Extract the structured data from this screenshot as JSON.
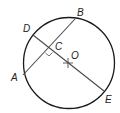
{
  "diagram": {
    "type": "circle-chord-geometry",
    "circle": {
      "center": [
        69,
        63
      ],
      "radius": 46,
      "stroke": "#1a1a1a"
    },
    "points": {
      "A": {
        "label": "A",
        "pos": [
          23,
          75
        ]
      },
      "B": {
        "label": "B",
        "pos": [
          75,
          19
        ]
      },
      "C": {
        "label": "C",
        "pos": [
          49,
          49
        ]
      },
      "D": {
        "label": "D",
        "pos": [
          33,
          35
        ]
      },
      "E": {
        "label": "E",
        "pos": [
          104,
          91
        ]
      },
      "O": {
        "label": "O",
        "pos": [
          68,
          63
        ]
      }
    },
    "segments": [
      {
        "name": "chord-AB",
        "from": "A",
        "to": "B"
      },
      {
        "name": "chord-DE",
        "from": "D",
        "to": "E"
      }
    ],
    "annotations": {
      "right_angle_at": "C",
      "center_marker": "O"
    },
    "line_color": "#4a4a4a"
  }
}
